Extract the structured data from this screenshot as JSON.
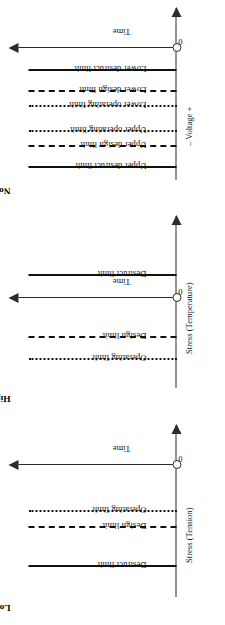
{
  "figure": {
    "panels": [
      {
        "id": "nominal-is-best",
        "title": "Nominal-is-Best",
        "x_axis_label": "– Voltage +",
        "y_axis_label": "Time",
        "origin_label": "0",
        "limits": [
          {
            "label": "Upper destruct limit",
            "style": "solid",
            "pos": 12
          },
          {
            "label": "Upper design limit",
            "style": "dashed",
            "pos": 33
          },
          {
            "label": "Upper operating limit",
            "style": "dashdot",
            "pos": 48
          },
          {
            "label": "Lower operating limit",
            "style": "dashdot",
            "pos": 73
          },
          {
            "label": "Lower design limit",
            "style": "dashed",
            "pos": 88
          },
          {
            "label": "Lower destruct limit",
            "style": "solid",
            "pos": 109
          }
        ],
        "time_axis_pos": 132
      },
      {
        "id": "higher-is-best",
        "title": "Higher-is-Best",
        "x_axis_label": "Stress (Temperature)",
        "y_axis_label": "Time",
        "origin_label": "0",
        "limits": [
          {
            "label": "Operating limit",
            "style": "dashdot",
            "pos": 28
          },
          {
            "label": "Design limit",
            "style": "dashed",
            "pos": 50
          },
          {
            "label": "Destruct limit",
            "style": "solid",
            "pos": 112
          }
        ],
        "time_axis_pos": 90
      },
      {
        "id": "lower-is-best",
        "title": "Lower-is-Best",
        "x_axis_label": "Stress (Tension)",
        "y_axis_label": "Time",
        "origin_label": "0",
        "limits": [
          {
            "label": "Destruct limit",
            "style": "solid",
            "pos": 30
          },
          {
            "label": "Design limit",
            "style": "dashed",
            "pos": 69
          },
          {
            "label": "Operating limit",
            "style": "dashdot",
            "pos": 85
          }
        ],
        "time_axis_pos": 132
      }
    ]
  },
  "chart_data": {
    "type": "line",
    "orientation": "rotated-90-ccw",
    "panels": [
      {
        "title": "Nominal-is-Best",
        "xlabel": "– Voltage +",
        "ylabel": "Time",
        "origin": "0",
        "grid": false,
        "legend": "none",
        "series": [
          {
            "name": "Upper destruct limit",
            "linestyle": "solid",
            "x": 12
          },
          {
            "name": "Upper design limit",
            "linestyle": "dashed",
            "x": 33
          },
          {
            "name": "Upper operating limit",
            "linestyle": "dash-dot",
            "x": 48
          },
          {
            "name": "Lower operating limit",
            "linestyle": "dash-dot",
            "x": 73
          },
          {
            "name": "Lower design limit",
            "linestyle": "dashed",
            "x": 88
          },
          {
            "name": "Lower destruct limit",
            "linestyle": "solid",
            "x": 109
          }
        ]
      },
      {
        "title": "Higher-is-Best",
        "xlabel": "Stress (Temperature)",
        "ylabel": "Time",
        "origin": "0",
        "grid": false,
        "legend": "none",
        "series": [
          {
            "name": "Operating limit",
            "linestyle": "dash-dot",
            "x": 28
          },
          {
            "name": "Design limit",
            "linestyle": "dashed",
            "x": 50
          },
          {
            "name": "Destruct limit",
            "linestyle": "solid",
            "x": 112
          }
        ]
      },
      {
        "title": "Lower-is-Best",
        "xlabel": "Stress (Tension)",
        "ylabel": "Time",
        "origin": "0",
        "grid": false,
        "legend": "none",
        "series": [
          {
            "name": "Destruct limit",
            "linestyle": "solid",
            "x": 30
          },
          {
            "name": "Design limit",
            "linestyle": "dashed",
            "x": 69
          },
          {
            "name": "Operating limit",
            "linestyle": "dash-dot",
            "x": 85
          }
        ]
      }
    ]
  }
}
